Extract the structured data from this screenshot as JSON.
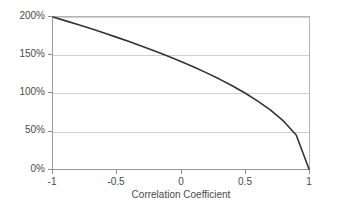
{
  "chart_data": {
    "type": "line",
    "title": "",
    "xlabel": "Correlation Coefficient",
    "ylabel": "",
    "xlim": [
      -1,
      1
    ],
    "ylim": [
      0,
      200
    ],
    "grid": true,
    "legend": false,
    "x_ticks": [
      -1,
      -0.5,
      0,
      0.5,
      1
    ],
    "x_tick_labels": [
      "-1",
      "-0.5",
      "0",
      "0.5",
      "1"
    ],
    "y_ticks": [
      0,
      50,
      100,
      150,
      200
    ],
    "y_tick_labels": [
      "0%",
      "50%",
      "100%",
      "150%",
      "200%"
    ],
    "series": [
      {
        "name": "",
        "color": "#333333",
        "x": [
          -1.0,
          -0.9,
          -0.8,
          -0.7,
          -0.6,
          -0.5,
          -0.4,
          -0.3,
          -0.2,
          -0.1,
          0.0,
          0.1,
          0.2,
          0.3,
          0.4,
          0.5,
          0.6,
          0.7,
          0.8,
          0.9,
          1.0
        ],
        "y": [
          200.0,
          194.9,
          189.7,
          184.4,
          179.0,
          173.2,
          167.3,
          161.2,
          154.9,
          148.3,
          141.4,
          134.2,
          126.5,
          118.3,
          109.5,
          100.0,
          89.4,
          77.5,
          63.2,
          44.7,
          0.0
        ]
      }
    ]
  },
  "axis": {
    "x_title": "Correlation Coefficient"
  },
  "y_labels": {
    "t0": "0%",
    "t50": "50%",
    "t100": "100%",
    "t150": "150%",
    "t200": "200%"
  },
  "x_labels": {
    "t_neg1": "-1",
    "t_neg05": "-0.5",
    "t_0": "0",
    "t_05": "0.5",
    "t_1": "1"
  },
  "colors": {
    "curve": "#333333",
    "gridline": "#d0d0d0",
    "axis": "#8d8d8d",
    "text": "#4a4a4a",
    "background": "#ffffff"
  }
}
